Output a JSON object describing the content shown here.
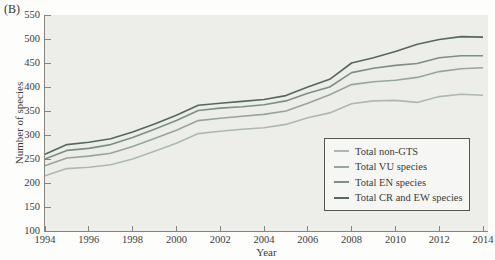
{
  "figure_label": "(B)",
  "chart_data": {
    "type": "line",
    "title": "",
    "xlabel": "Year",
    "ylabel": "Number of species",
    "x_range": [
      1994,
      2014
    ],
    "ylim": [
      100,
      550
    ],
    "x_ticks": [
      1994,
      1996,
      1998,
      2000,
      2002,
      2004,
      2006,
      2008,
      2010,
      2012,
      2014
    ],
    "y_ticks": [
      100,
      150,
      200,
      250,
      300,
      350,
      400,
      450,
      500,
      550
    ],
    "grid": false,
    "legend_position": "inside lower-right box",
    "x": [
      1994,
      1995,
      1996,
      1997,
      1998,
      1999,
      2000,
      2001,
      2002,
      2003,
      2004,
      2005,
      2006,
      2007,
      2008,
      2009,
      2010,
      2011,
      2012,
      2013,
      2014
    ],
    "series": [
      {
        "name": "Total non-GTS",
        "color": "#aeb9ae",
        "values": [
          215,
          230,
          233,
          238,
          250,
          266,
          283,
          303,
          308,
          312,
          315,
          322,
          336,
          346,
          365,
          371,
          372,
          368,
          380,
          385,
          383
        ]
      },
      {
        "name": "Total VU species",
        "color": "#98a69a",
        "values": [
          236,
          252,
          256,
          262,
          276,
          293,
          310,
          330,
          335,
          339,
          343,
          350,
          366,
          384,
          405,
          411,
          414,
          420,
          432,
          438,
          440
        ]
      },
      {
        "name": "Total EN species",
        "color": "#7d8f83",
        "values": [
          250,
          268,
          272,
          280,
          295,
          312,
          330,
          351,
          356,
          359,
          363,
          371,
          387,
          400,
          430,
          439,
          445,
          449,
          461,
          465,
          465
        ]
      },
      {
        "name": "Total CR and EW species",
        "color": "#56685d",
        "values": [
          260,
          280,
          285,
          292,
          306,
          323,
          341,
          362,
          366,
          370,
          374,
          382,
          400,
          416,
          450,
          461,
          474,
          489,
          499,
          505,
          504
        ]
      }
    ]
  },
  "colors": {
    "plot_background": "#edeeea",
    "axis": "#85857f",
    "text": "#3b3b39",
    "legend_background": "#f6f7f4",
    "legend_border": "#55554f"
  }
}
